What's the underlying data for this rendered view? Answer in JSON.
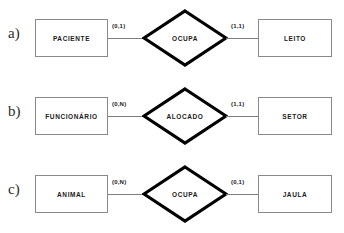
{
  "diagram": {
    "type": "entity-relationship-diagram",
    "notation": "min-max cardinality",
    "background_color": "#ffffff",
    "line_color": "#7d7d7d",
    "entity_border_color": "#8a8a8a",
    "relationship_border_color": "#000000",
    "text_color": "#1a1a1a",
    "rows": [
      {
        "label": "a)",
        "left_entity": "PACIENTE",
        "left_cardinality": "(0,1)",
        "relationship": "OCUPA",
        "right_cardinality": "(1,1)",
        "right_entity": "LEITO"
      },
      {
        "label": "b)",
        "left_entity": "FUNCIONÁRIO",
        "left_cardinality": "(0,N)",
        "relationship": "ALOCADO",
        "right_cardinality": "(1,1)",
        "right_entity": "SETOR"
      },
      {
        "label": "c)",
        "left_entity": "ANIMAL",
        "left_cardinality": "(0,N)",
        "relationship": "OCUPA",
        "right_cardinality": "(0,1)",
        "right_entity": "JAULA"
      }
    ]
  }
}
